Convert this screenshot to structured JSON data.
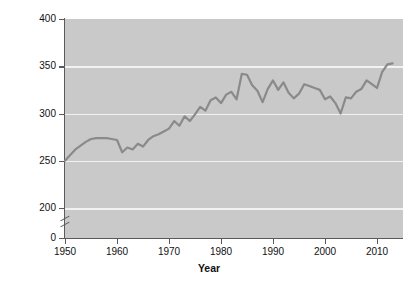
{
  "chart_data": {
    "type": "line",
    "title": "",
    "xlabel": "Year",
    "ylabel": "Per capita grain production (kg)",
    "xlim": [
      1950,
      2015
    ],
    "ylim": [
      190,
      400
    ],
    "y_axis_break": true,
    "y_axis_break_label": "0",
    "ytick_labels": [
      "400",
      "350",
      "300",
      "250",
      "200",
      "0"
    ],
    "ytick_values": [
      400,
      350,
      300,
      250,
      200,
      0
    ],
    "xtick_labels": [
      "1950",
      "1960",
      "1970",
      "1980",
      "1990",
      "2000",
      "2010"
    ],
    "xtick_values": [
      1950,
      1960,
      1970,
      1980,
      1990,
      2000,
      2010
    ],
    "grid": "horizontal",
    "legend": "none",
    "series": [
      {
        "name": "Per capita grain production",
        "color": "#8a8a8a",
        "x": [
          1950,
          1951,
          1952,
          1953,
          1954,
          1955,
          1956,
          1957,
          1958,
          1959,
          1960,
          1961,
          1962,
          1963,
          1964,
          1965,
          1966,
          1967,
          1968,
          1969,
          1970,
          1971,
          1972,
          1973,
          1974,
          1975,
          1976,
          1977,
          1978,
          1979,
          1980,
          1981,
          1982,
          1983,
          1984,
          1985,
          1986,
          1987,
          1988,
          1989,
          1990,
          1991,
          1992,
          1993,
          1994,
          1995,
          1996,
          1997,
          1998,
          1999,
          2000,
          2001,
          2002,
          2003,
          2004,
          2005,
          2006,
          2007,
          2008,
          2009,
          2010,
          2011,
          2012,
          2013
        ],
        "y": [
          250,
          256,
          262,
          266,
          270,
          273,
          274,
          274,
          274,
          273,
          272,
          259,
          264,
          262,
          268,
          265,
          272,
          276,
          278,
          281,
          284,
          292,
          287,
          297,
          292,
          299,
          307,
          303,
          314,
          317,
          311,
          320,
          323,
          315,
          342,
          341,
          330,
          324,
          312,
          326,
          335,
          325,
          333,
          322,
          316,
          321,
          331,
          329,
          327,
          325,
          315,
          318,
          311,
          300,
          317,
          316,
          323,
          326,
          335,
          331,
          327,
          344,
          352,
          353
        ]
      }
    ]
  }
}
